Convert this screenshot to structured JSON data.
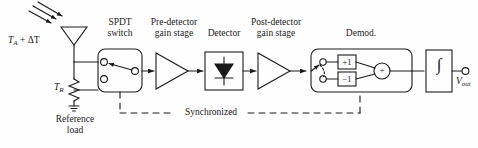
{
  "diagram": {
    "background_color": "#fefefe",
    "line_color": "#1a1a1a",
    "labels": {
      "antenna_temp": "T",
      "antenna_temp_sub": "A",
      "antenna_temp_rest": " + ΔT",
      "reference_temp": "T",
      "reference_temp_sub": "R",
      "reference_load_line1": "Reference",
      "reference_load_line2": "load",
      "spdt_line1": "SPDT",
      "spdt_line2": "switch",
      "predetector_line1": "Pre-detector",
      "predetector_line2": "gain stage",
      "detector": "Detector",
      "postdetector_line1": "Post-detector",
      "postdetector_line2": "gain stage",
      "demod": "Demod.",
      "synchronized": "Synchronized",
      "gain_plus": "+1",
      "gain_minus": "−1",
      "summer": "+",
      "integrator": "∫",
      "output": "V",
      "output_sub": "out"
    }
  }
}
